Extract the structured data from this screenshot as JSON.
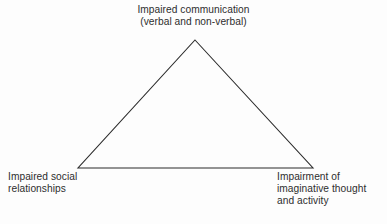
{
  "diagram": {
    "background_color": "#fdfdfd",
    "stroke_color": "#2b2b2b",
    "text_color": "#2e2e2e",
    "shape": "triangle",
    "vertices": {
      "apex": {
        "x": 195,
        "y": 40
      },
      "bottom_left": {
        "x": 78,
        "y": 168
      },
      "bottom_right": {
        "x": 313,
        "y": 168
      }
    }
  },
  "labels": {
    "top": {
      "line1": "Impaired communication",
      "line2": "(verbal and non-verbal)"
    },
    "bottom_left": {
      "line1": "Impaired social",
      "line2": "relationships"
    },
    "bottom_right": {
      "line1": "Impairment of",
      "line2": "imaginative thought",
      "line3": "and activity"
    }
  }
}
